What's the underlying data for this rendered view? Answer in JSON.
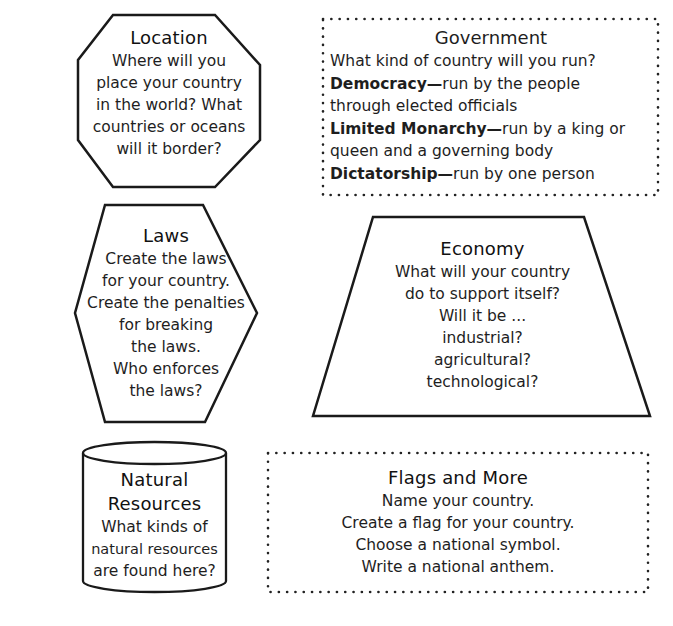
{
  "location": {
    "title": "Location",
    "lines": [
      "Where will you",
      "place your country",
      "in the world? What",
      "countries or oceans",
      "will it border?"
    ],
    "shape": "octagon"
  },
  "government": {
    "title": "Government",
    "intro": "What kind of country will you run?",
    "options": [
      {
        "term": "Democracy",
        "dash": "—",
        "desc1": "run by the people",
        "desc2": "through elected officials"
      },
      {
        "term": "Limited Monarchy",
        "dash": "—",
        "desc1": "run by a king or",
        "desc2": "queen and a governing body"
      },
      {
        "term": "Dictatorship",
        "dash": "—",
        "desc1": "run by one person",
        "desc2": ""
      }
    ],
    "shape": "dotted-rectangle"
  },
  "laws": {
    "title": "Laws",
    "lines": [
      "Create the laws",
      "for your country.",
      "Create the penalties",
      "for breaking",
      "the laws.",
      "Who enforces",
      "the laws?"
    ],
    "shape": "hexagon"
  },
  "economy": {
    "title": "Economy",
    "lines": [
      "What will your country",
      "do to support itself?",
      "Will it be ...",
      "industrial?",
      "agricultural?",
      "technological?"
    ],
    "shape": "trapezoid"
  },
  "natural_resources": {
    "title_line1": "Natural",
    "title_line2": "Resources",
    "lines": [
      "What kinds of",
      "natural resources",
      "are found here?"
    ],
    "shape": "cylinder"
  },
  "flags": {
    "title": "Flags and More",
    "lines": [
      "Name your country.",
      "Create a flag for your country.",
      "Choose a national symbol.",
      "Write a national anthem."
    ],
    "shape": "dotted-rectangle"
  },
  "colors": {
    "stroke": "#1a1a1a",
    "text": "#1e1e1e",
    "background": "#ffffff"
  }
}
